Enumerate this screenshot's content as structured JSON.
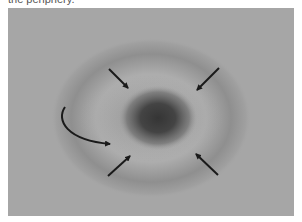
{
  "caption": {
    "text_fragment": "the periphery."
  },
  "figure": {
    "colors": {
      "background": "#a6a6a6",
      "ring": "#8f8f8f",
      "inner_halo": "#adadad",
      "center": "#3c3c3c",
      "arrow": "#1a1a1a"
    },
    "annotations": {
      "straight_arrows": [
        {
          "name": "arrow-top-left",
          "direction": "down-right"
        },
        {
          "name": "arrow-top-right",
          "direction": "down-left"
        },
        {
          "name": "arrow-bottom-left",
          "direction": "up-right"
        },
        {
          "name": "arrow-bottom-right",
          "direction": "up-left"
        }
      ],
      "curved_arrow": {
        "name": "curved-arrow-left",
        "direction": "down-then-right"
      }
    }
  }
}
